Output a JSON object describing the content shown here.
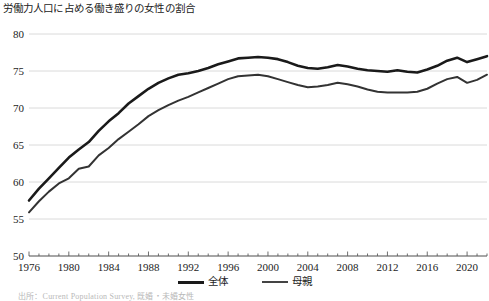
{
  "chart_data": {
    "type": "line",
    "title": "労働力人口に占める働き盛りの女性の割合",
    "xlabel": "",
    "ylabel": "",
    "ylim": [
      50,
      80
    ],
    "xlim": [
      1976,
      2022
    ],
    "grid": true,
    "legend_position": "bottom-center",
    "yticks": [
      50,
      55,
      60,
      65,
      70,
      75,
      80
    ],
    "xticks": [
      1976,
      1980,
      1984,
      1988,
      1992,
      1996,
      2000,
      2004,
      2008,
      2012,
      2016,
      2020
    ],
    "x": [
      1976,
      1977,
      1978,
      1979,
      1980,
      1981,
      1982,
      1983,
      1984,
      1985,
      1986,
      1987,
      1988,
      1989,
      1990,
      1991,
      1992,
      1993,
      1994,
      1995,
      1996,
      1997,
      1998,
      1999,
      2000,
      2001,
      2002,
      2003,
      2004,
      2005,
      2006,
      2007,
      2008,
      2009,
      2010,
      2011,
      2012,
      2013,
      2014,
      2015,
      2016,
      2017,
      2018,
      2019,
      2020,
      2021,
      2022
    ],
    "series": [
      {
        "name": "全体",
        "color": "#1a1a1a",
        "width": 2.6,
        "values": [
          57.5,
          59.1,
          60.5,
          61.9,
          63.3,
          64.4,
          65.4,
          66.9,
          68.2,
          69.3,
          70.6,
          71.6,
          72.6,
          73.4,
          74.0,
          74.5,
          74.7,
          75.0,
          75.4,
          75.9,
          76.3,
          76.7,
          76.8,
          76.9,
          76.8,
          76.6,
          76.2,
          75.7,
          75.4,
          75.3,
          75.5,
          75.8,
          75.6,
          75.3,
          75.1,
          75.0,
          74.9,
          75.1,
          74.9,
          74.8,
          75.2,
          75.7,
          76.4,
          76.8,
          76.2,
          76.6,
          77.0
        ]
      },
      {
        "name": "母親",
        "color": "#333333",
        "width": 2.0,
        "values": [
          55.9,
          57.4,
          58.7,
          59.8,
          60.5,
          61.8,
          62.1,
          63.6,
          64.6,
          65.8,
          66.8,
          67.8,
          68.9,
          69.7,
          70.4,
          71.0,
          71.5,
          72.1,
          72.7,
          73.3,
          73.9,
          74.3,
          74.4,
          74.5,
          74.3,
          73.9,
          73.5,
          73.1,
          72.8,
          72.9,
          73.1,
          73.4,
          73.2,
          72.9,
          72.5,
          72.2,
          72.1,
          72.1,
          72.1,
          72.2,
          72.6,
          73.3,
          73.9,
          74.2,
          73.4,
          73.8,
          74.5
        ]
      }
    ],
    "legend": [
      {
        "label": "全体",
        "color": "#1a1a1a",
        "width": 3.2
      },
      {
        "label": "母親",
        "color": "#444444",
        "width": 2.4
      }
    ],
    "source_note": "出所：Current Population Survey, 既婚・未婚女性"
  }
}
